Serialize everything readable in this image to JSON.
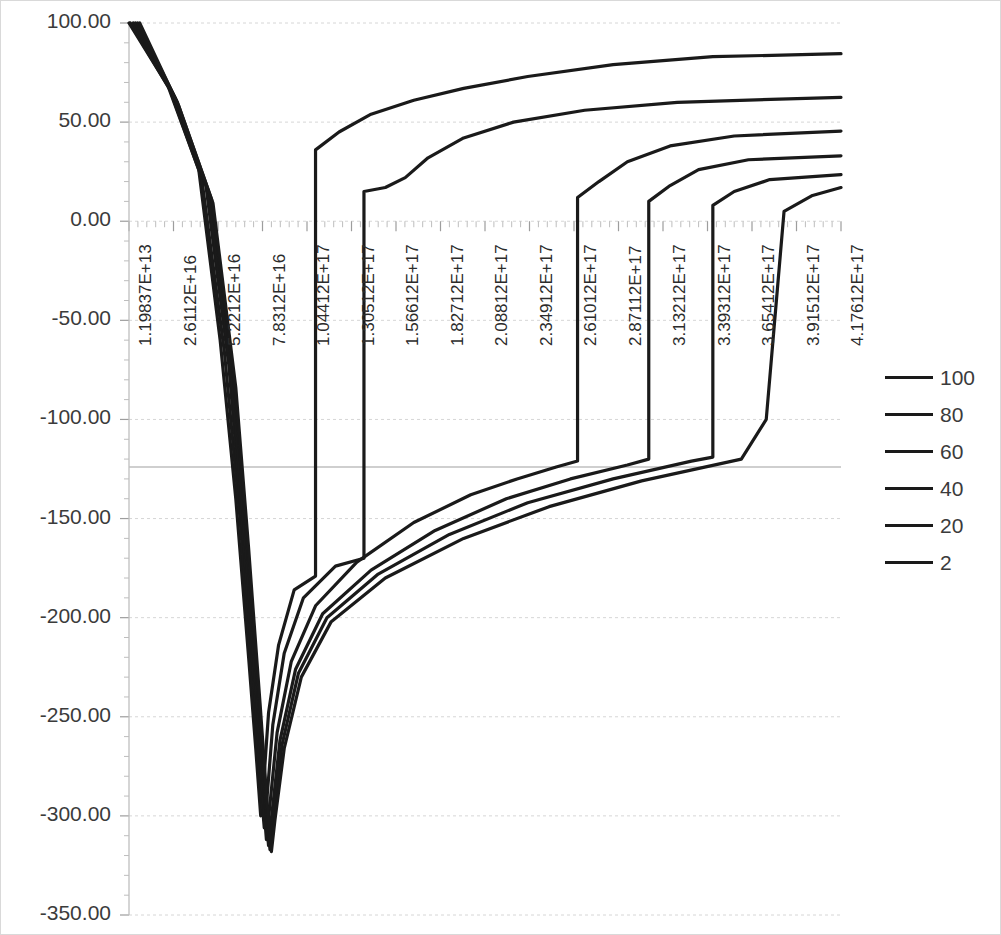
{
  "chart_data": {
    "type": "line",
    "title": "",
    "xlabel": "",
    "ylabel": "",
    "grid": true,
    "legend_position": "right",
    "ylim": [
      -350,
      100
    ],
    "ytick_labels": [
      "100.00",
      "50.00",
      "0.00",
      "-50.00",
      "-100.00",
      "-150.00",
      "-200.00",
      "-250.00",
      "-300.00",
      "-350.00"
    ],
    "ytick_values": [
      100,
      50,
      0,
      -50,
      -100,
      -150,
      -200,
      -250,
      -300,
      -350
    ],
    "xtick_labels": [
      "1.19837E+13",
      "2.6112E+16",
      "5.2212E+16",
      "7.8312E+16",
      "1.04412E+17",
      "1.30512E+17",
      "1.56612E+17",
      "1.82712E+17",
      "2.08812E+17",
      "2.34912E+17",
      "2.61012E+17",
      "2.87112E+17",
      "3.13212E+17",
      "3.39312E+17",
      "3.65412E+17",
      "3.91512E+17",
      "4.17612E+17"
    ],
    "legend_entries": [
      "100",
      "80",
      "60",
      "40",
      "20",
      "2"
    ],
    "series": [
      {
        "name": "100",
        "color": "#1a1a1a",
        "points": [
          [
            0.0,
            100.0
          ],
          [
            0.055,
            68.0
          ],
          [
            0.098,
            26.0
          ],
          [
            0.128,
            -60.0
          ],
          [
            0.15,
            -140.0
          ],
          [
            0.168,
            -220.0
          ],
          [
            0.178,
            -266.0
          ],
          [
            0.185,
            -300.0
          ],
          [
            0.189,
            -284.0
          ],
          [
            0.196,
            -248.0
          ],
          [
            0.21,
            -214.0
          ],
          [
            0.232,
            -186.0
          ],
          [
            0.262,
            -179.0
          ],
          [
            0.262,
            36.0
          ],
          [
            0.295,
            45.0
          ],
          [
            0.34,
            54.0
          ],
          [
            0.4,
            61.0
          ],
          [
            0.47,
            67.0
          ],
          [
            0.56,
            73.0
          ],
          [
            0.68,
            79.0
          ],
          [
            0.82,
            83.0
          ],
          [
            1.0,
            84.5
          ]
        ]
      },
      {
        "name": "80",
        "color": "#1a1a1a",
        "points": [
          [
            0.002,
            100.0
          ],
          [
            0.058,
            66.0
          ],
          [
            0.102,
            22.0
          ],
          [
            0.134,
            -66.0
          ],
          [
            0.156,
            -150.0
          ],
          [
            0.172,
            -228.0
          ],
          [
            0.182,
            -272.0
          ],
          [
            0.19,
            -306.0
          ],
          [
            0.194,
            -290.0
          ],
          [
            0.202,
            -254.0
          ],
          [
            0.218,
            -218.0
          ],
          [
            0.245,
            -190.0
          ],
          [
            0.29,
            -174.0
          ],
          [
            0.33,
            -170.0
          ],
          [
            0.33,
            15.0
          ],
          [
            0.36,
            17.0
          ],
          [
            0.388,
            22.0
          ],
          [
            0.42,
            32.0
          ],
          [
            0.47,
            42.0
          ],
          [
            0.54,
            50.0
          ],
          [
            0.64,
            56.0
          ],
          [
            0.77,
            60.0
          ],
          [
            1.0,
            62.5
          ]
        ]
      },
      {
        "name": "60",
        "color": "#1a1a1a",
        "points": [
          [
            0.006,
            100.0
          ],
          [
            0.062,
            64.0
          ],
          [
            0.108,
            18.0
          ],
          [
            0.14,
            -72.0
          ],
          [
            0.16,
            -156.0
          ],
          [
            0.176,
            -234.0
          ],
          [
            0.186,
            -280.0
          ],
          [
            0.193,
            -312.0
          ],
          [
            0.198,
            -294.0
          ],
          [
            0.208,
            -258.0
          ],
          [
            0.228,
            -222.0
          ],
          [
            0.262,
            -194.0
          ],
          [
            0.32,
            -172.0
          ],
          [
            0.4,
            -152.0
          ],
          [
            0.48,
            -138.0
          ],
          [
            0.545,
            -130.0
          ],
          [
            0.6,
            -124.0
          ],
          [
            0.63,
            -121.0
          ],
          [
            0.63,
            12.0
          ],
          [
            0.66,
            20.0
          ],
          [
            0.7,
            30.0
          ],
          [
            0.76,
            38.0
          ],
          [
            0.85,
            43.0
          ],
          [
            1.0,
            45.5
          ]
        ]
      },
      {
        "name": "40",
        "color": "#1a1a1a",
        "points": [
          [
            0.009,
            100.0
          ],
          [
            0.065,
            62.0
          ],
          [
            0.112,
            14.0
          ],
          [
            0.144,
            -78.0
          ],
          [
            0.163,
            -160.0
          ],
          [
            0.179,
            -238.0
          ],
          [
            0.189,
            -284.0
          ],
          [
            0.196,
            -315.0
          ],
          [
            0.201,
            -298.0
          ],
          [
            0.212,
            -262.0
          ],
          [
            0.234,
            -226.0
          ],
          [
            0.272,
            -198.0
          ],
          [
            0.34,
            -176.0
          ],
          [
            0.43,
            -156.0
          ],
          [
            0.53,
            -140.0
          ],
          [
            0.62,
            -130.0
          ],
          [
            0.7,
            -123.0
          ],
          [
            0.73,
            -120.0
          ],
          [
            0.73,
            10.0
          ],
          [
            0.76,
            18.0
          ],
          [
            0.8,
            26.0
          ],
          [
            0.87,
            31.0
          ],
          [
            1.0,
            33.0
          ]
        ]
      },
      {
        "name": "20",
        "color": "#1a1a1a",
        "points": [
          [
            0.012,
            100.0
          ],
          [
            0.068,
            60.0
          ],
          [
            0.116,
            11.0
          ],
          [
            0.148,
            -82.0
          ],
          [
            0.166,
            -163.0
          ],
          [
            0.182,
            -241.0
          ],
          [
            0.191,
            -287.0
          ],
          [
            0.198,
            -317.0
          ],
          [
            0.203,
            -300.0
          ],
          [
            0.215,
            -264.0
          ],
          [
            0.238,
            -228.0
          ],
          [
            0.278,
            -200.0
          ],
          [
            0.35,
            -178.0
          ],
          [
            0.45,
            -158.0
          ],
          [
            0.56,
            -142.0
          ],
          [
            0.68,
            -130.0
          ],
          [
            0.79,
            -121.0
          ],
          [
            0.82,
            -119.0
          ],
          [
            0.82,
            8.0
          ],
          [
            0.85,
            15.0
          ],
          [
            0.9,
            21.0
          ],
          [
            1.0,
            23.5
          ]
        ]
      },
      {
        "name": "2",
        "color": "#1a1a1a",
        "points": [
          [
            0.015,
            100.0
          ],
          [
            0.07,
            58.0
          ],
          [
            0.118,
            9.0
          ],
          [
            0.15,
            -84.0
          ],
          [
            0.168,
            -165.0
          ],
          [
            0.184,
            -243.0
          ],
          [
            0.193,
            -289.0
          ],
          [
            0.2,
            -318.0
          ],
          [
            0.205,
            -302.0
          ],
          [
            0.218,
            -266.0
          ],
          [
            0.242,
            -230.0
          ],
          [
            0.284,
            -202.0
          ],
          [
            0.36,
            -180.0
          ],
          [
            0.47,
            -160.0
          ],
          [
            0.59,
            -144.0
          ],
          [
            0.72,
            -131.0
          ],
          [
            0.86,
            -120.0
          ],
          [
            0.895,
            -100.0
          ],
          [
            0.895,
            -100.0
          ],
          [
            0.92,
            5.0
          ],
          [
            0.96,
            13.0
          ],
          [
            1.0,
            17.0
          ]
        ]
      }
    ]
  },
  "axes": {
    "plot_left_px": 128,
    "plot_right_px": 840,
    "plot_top_px": 22,
    "plot_bottom_px": 914
  }
}
